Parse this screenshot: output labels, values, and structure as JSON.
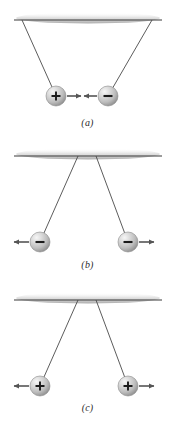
{
  "figure": {
    "width": 175,
    "height": 425,
    "background": "#ffffff"
  },
  "colors": {
    "ceiling_line": "#3a3a3a",
    "ceiling_shadow": "#b8b8b8",
    "string": "#4a4a4a",
    "arrow": "#555555",
    "sphere_highlight": "#f2f2f2",
    "sphere_mid": "#c9c9c9",
    "sphere_edge": "#8f8f8f",
    "sign_glyph": "#1a1a1a",
    "caption_text": "#2b2b2b"
  },
  "panels": [
    {
      "id": "a",
      "caption": "(a)",
      "interaction": "attraction",
      "ceiling": {
        "y": 20,
        "x_start": 14,
        "x_end": 162
      },
      "charges": [
        {
          "sign": "+",
          "symbol": "+",
          "cx": 56,
          "cy": 96,
          "r": 10,
          "arrow_direction": "right"
        },
        {
          "sign": "-",
          "symbol": "−",
          "cx": 108,
          "cy": 96,
          "r": 10,
          "arrow_direction": "left"
        }
      ],
      "strings": [
        {
          "x1": 22,
          "y1": 20,
          "x2": 56,
          "y2": 96
        },
        {
          "x1": 152,
          "y1": 20,
          "x2": 108,
          "y2": 96
        }
      ]
    },
    {
      "id": "b",
      "caption": "(b)",
      "interaction": "repulsion",
      "ceiling": {
        "y": 156,
        "x_start": 14,
        "x_end": 162
      },
      "charges": [
        {
          "sign": "-",
          "symbol": "−",
          "cx": 40,
          "cy": 242,
          "r": 10,
          "arrow_direction": "left"
        },
        {
          "sign": "-",
          "symbol": "−",
          "cx": 128,
          "cy": 242,
          "r": 10,
          "arrow_direction": "right"
        }
      ],
      "strings": [
        {
          "x1": 78,
          "y1": 156,
          "x2": 40,
          "y2": 242
        },
        {
          "x1": 96,
          "y1": 156,
          "x2": 128,
          "y2": 242
        }
      ]
    },
    {
      "id": "c",
      "caption": "(c)",
      "interaction": "repulsion",
      "ceiling": {
        "y": 300,
        "x_start": 14,
        "x_end": 162
      },
      "charges": [
        {
          "sign": "+",
          "symbol": "+",
          "cx": 40,
          "cy": 386,
          "r": 10,
          "arrow_direction": "left"
        },
        {
          "sign": "+",
          "symbol": "+",
          "cx": 128,
          "cy": 386,
          "r": 10,
          "arrow_direction": "right"
        }
      ],
      "strings": [
        {
          "x1": 78,
          "y1": 300,
          "x2": 40,
          "y2": 386
        },
        {
          "x1": 96,
          "y1": 300,
          "x2": 128,
          "y2": 386
        }
      ]
    }
  ]
}
